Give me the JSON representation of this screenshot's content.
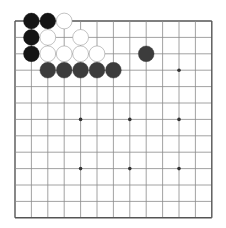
{
  "board": {
    "size": 13,
    "origin_x": 15,
    "origin_y": 21,
    "spacing": 16.4,
    "line_color": "#8a8a8a",
    "border_color": "#555555",
    "star_points": [
      [
        4,
        3
      ],
      [
        10,
        3
      ],
      [
        4,
        6
      ],
      [
        7,
        6
      ],
      [
        10,
        6
      ],
      [
        4,
        9
      ],
      [
        7,
        9
      ],
      [
        10,
        9
      ]
    ],
    "stones": [
      {
        "col": 1,
        "row": 0,
        "color": "black"
      },
      {
        "col": 2,
        "row": 0,
        "color": "black"
      },
      {
        "col": 3,
        "row": 0,
        "color": "white"
      },
      {
        "col": 1,
        "row": 1,
        "color": "black"
      },
      {
        "col": 2,
        "row": 1,
        "color": "white"
      },
      {
        "col": 4,
        "row": 1,
        "color": "white"
      },
      {
        "col": 1,
        "row": 2,
        "color": "black"
      },
      {
        "col": 2,
        "row": 2,
        "color": "white"
      },
      {
        "col": 3,
        "row": 2,
        "color": "white"
      },
      {
        "col": 4,
        "row": 2,
        "color": "white"
      },
      {
        "col": 5,
        "row": 2,
        "color": "white"
      },
      {
        "col": 8,
        "row": 2,
        "color": "gray"
      },
      {
        "col": 2,
        "row": 3,
        "color": "gray"
      },
      {
        "col": 3,
        "row": 3,
        "color": "gray"
      },
      {
        "col": 4,
        "row": 3,
        "color": "gray"
      },
      {
        "col": 5,
        "row": 3,
        "color": "gray"
      },
      {
        "col": 6,
        "row": 3,
        "color": "gray"
      }
    ],
    "colors": {
      "black": "#141414",
      "gray": "#3c3c3c",
      "white": "#ffffff",
      "white_stroke": "#9a9a9a"
    }
  }
}
